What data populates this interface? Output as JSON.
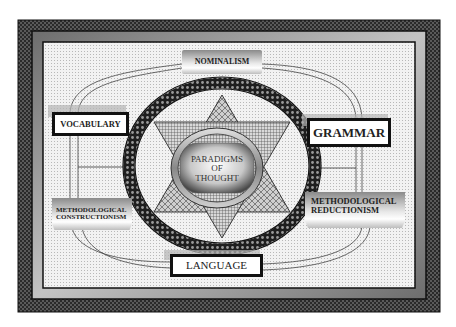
{
  "diagram": {
    "center": {
      "line1": "PARADIGMS",
      "line2": "OF",
      "line3": "THOUGHT"
    },
    "nodes": {
      "top": "NOMINALISM",
      "left": "VOCABULARY",
      "right": "GRAMMAR",
      "bottom_left_1": "METHODOLOGICAL",
      "bottom_left_2": "CONSTRUCTIONISM",
      "bottom_right_1": "METHODOLOGICAL",
      "bottom_right_2": "REDUCTIONISM",
      "bottom": "LANGUAGE"
    },
    "colors": {
      "frame_dark": "#3a3a3a",
      "frame_mid": "#8c8c8c",
      "background_light": "#ececec",
      "ring": "#2a2a2a",
      "text": "#222222"
    }
  }
}
